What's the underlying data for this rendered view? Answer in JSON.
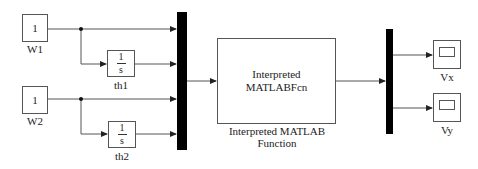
{
  "diagram": {
    "type": "simulink-block-diagram",
    "blocks": {
      "w1": {
        "value": "1",
        "label": "W1",
        "type": "Constant"
      },
      "w2": {
        "value": "1",
        "label": "W2",
        "type": "Constant"
      },
      "th1": {
        "numerator": "1",
        "denominator": "s",
        "label": "th1",
        "type": "Integrator"
      },
      "th2": {
        "numerator": "1",
        "denominator": "s",
        "label": "th2",
        "type": "Integrator"
      },
      "mux": {
        "type": "Mux",
        "inputs": 4
      },
      "fcn": {
        "line1": "Interpreted",
        "line2": "MATLABFcn",
        "caption1": "Interpreted MATLAB",
        "caption2": "Function",
        "type": "Interpreted MATLAB Function"
      },
      "demux": {
        "type": "Demux",
        "outputs": 2
      },
      "vx": {
        "label": "Vx",
        "type": "Scope"
      },
      "vy": {
        "label": "Vy",
        "type": "Scope"
      }
    },
    "connections": [
      {
        "from": "W1",
        "to": "Mux.in1"
      },
      {
        "from": "W1",
        "to": "th1"
      },
      {
        "from": "th1",
        "to": "Mux.in2"
      },
      {
        "from": "W2",
        "to": "Mux.in3"
      },
      {
        "from": "W2",
        "to": "th2"
      },
      {
        "from": "th2",
        "to": "Mux.in4"
      },
      {
        "from": "Mux",
        "to": "Interpreted MATLAB Function"
      },
      {
        "from": "Interpreted MATLAB Function",
        "to": "Demux"
      },
      {
        "from": "Demux.out1",
        "to": "Vx"
      },
      {
        "from": "Demux.out2",
        "to": "Vy"
      }
    ],
    "colors": {
      "line": "#555555",
      "bar": "#000000",
      "background": "#ffffff"
    }
  }
}
